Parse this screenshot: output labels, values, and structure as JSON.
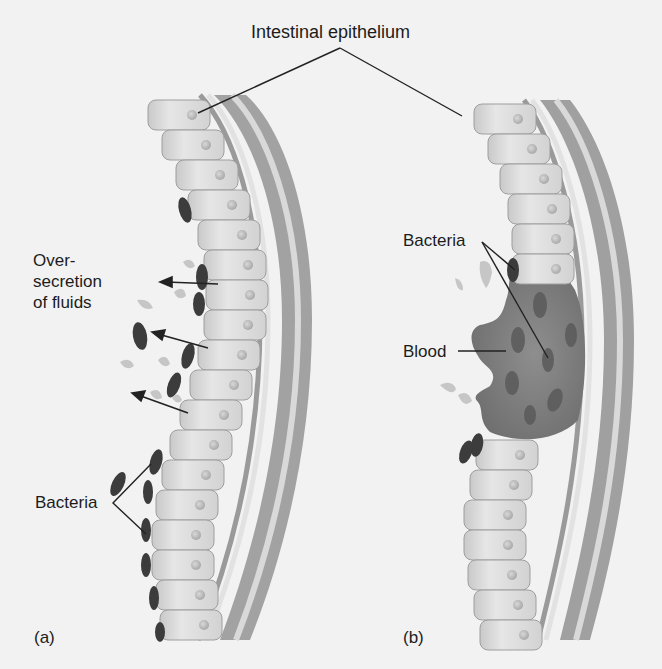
{
  "figure": {
    "title_label": "Intestinal epithelium",
    "panel_a": {
      "tag": "(a)",
      "labels": {
        "secretion_line1": "Over-",
        "secretion_line2": "secretion",
        "secretion_line3": "of fluids",
        "bacteria": "Bacteria"
      }
    },
    "panel_b": {
      "tag": "(b)",
      "labels": {
        "bacteria": "Bacteria",
        "blood": "Blood"
      }
    }
  },
  "colors": {
    "background": "#f2f2f2",
    "cell_fill": "#dcdcdc",
    "cell_edge": "#a8a8a8",
    "nucleus": "#bdbdbd",
    "layer_dark": "#9a9a9a",
    "layer_light": "#d8d8d8",
    "bacteria": "#3c3c3c",
    "lesion": "#8a8a8a",
    "droplet": "#c8c8c8",
    "leader_line": "#222222"
  }
}
